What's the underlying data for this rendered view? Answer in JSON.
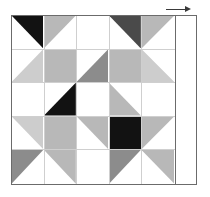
{
  "diagram": {
    "type": "quilt-block",
    "grid_rows": 5,
    "grid_columns": 5,
    "has_right_sashing_strip": true,
    "dimension_arrow": {
      "name": "width-arrow",
      "direction": "right",
      "label": ""
    }
  },
  "palette": {
    "background": "#ffffff",
    "black": "#121212",
    "dark_gray": "#4a4a4a",
    "medium_gray": "#8c8c8c",
    "light_gray": "#b8b8b8",
    "pale_gray": "#cdcdcd",
    "grid_line": "#cfcfcf",
    "frame_line": "#6b6b6b"
  },
  "chart_data": {
    "type": "heatmap",
    "xlabel": "",
    "ylabel": "",
    "categories": [
      "c1",
      "c2",
      "c3",
      "c4",
      "c5"
    ],
    "cells": [
      {
        "r": 1,
        "c": 1,
        "shape": "triangle",
        "corner": "tr",
        "color": "#121212"
      },
      {
        "r": 1,
        "c": 2,
        "shape": "triangle",
        "corner": "tl",
        "color": "#b8b8b8"
      },
      {
        "r": 1,
        "c": 3,
        "shape": "empty",
        "corner": "",
        "color": "#ffffff"
      },
      {
        "r": 1,
        "c": 4,
        "shape": "triangle",
        "corner": "tr",
        "color": "#4a4a4a"
      },
      {
        "r": 1,
        "c": 5,
        "shape": "triangle",
        "corner": "tl",
        "color": "#b8b8b8"
      },
      {
        "r": 2,
        "c": 1,
        "shape": "triangle",
        "corner": "br",
        "color": "#cdcdcd"
      },
      {
        "r": 2,
        "c": 2,
        "shape": "square",
        "corner": "",
        "color": "#b8b8b8"
      },
      {
        "r": 2,
        "c": 3,
        "shape": "triangle",
        "corner": "br",
        "color": "#8c8c8c"
      },
      {
        "r": 2,
        "c": 4,
        "shape": "square",
        "corner": "",
        "color": "#b8b8b8"
      },
      {
        "r": 2,
        "c": 5,
        "shape": "triangle",
        "corner": "bl",
        "color": "#cdcdcd"
      },
      {
        "r": 3,
        "c": 1,
        "shape": "empty",
        "corner": "",
        "color": "#ffffff"
      },
      {
        "r": 3,
        "c": 2,
        "shape": "triangle",
        "corner": "br",
        "color": "#121212"
      },
      {
        "r": 3,
        "c": 3,
        "shape": "empty",
        "corner": "",
        "color": "#ffffff"
      },
      {
        "r": 3,
        "c": 4,
        "shape": "triangle",
        "corner": "bl",
        "color": "#b8b8b8"
      },
      {
        "r": 3,
        "c": 5,
        "shape": "empty",
        "corner": "",
        "color": "#ffffff"
      },
      {
        "r": 4,
        "c": 1,
        "shape": "triangle",
        "corner": "tr",
        "color": "#cdcdcd"
      },
      {
        "r": 4,
        "c": 2,
        "shape": "square",
        "corner": "",
        "color": "#b8b8b8"
      },
      {
        "r": 4,
        "c": 3,
        "shape": "triangle",
        "corner": "tr",
        "color": "#b8b8b8"
      },
      {
        "r": 4,
        "c": 4,
        "shape": "square",
        "corner": "",
        "color": "#121212"
      },
      {
        "r": 4,
        "c": 5,
        "shape": "triangle",
        "corner": "tl",
        "color": "#b8b8b8"
      },
      {
        "r": 5,
        "c": 1,
        "shape": "triangle",
        "corner": "tl",
        "color": "#8c8c8c"
      },
      {
        "r": 5,
        "c": 2,
        "shape": "triangle",
        "corner": "tr",
        "color": "#b8b8b8"
      },
      {
        "r": 5,
        "c": 3,
        "shape": "empty",
        "corner": "",
        "color": "#ffffff"
      },
      {
        "r": 5,
        "c": 4,
        "shape": "triangle",
        "corner": "tl",
        "color": "#8c8c8c"
      },
      {
        "r": 5,
        "c": 5,
        "shape": "triangle",
        "corner": "tr",
        "color": "#b8b8b8"
      }
    ]
  }
}
